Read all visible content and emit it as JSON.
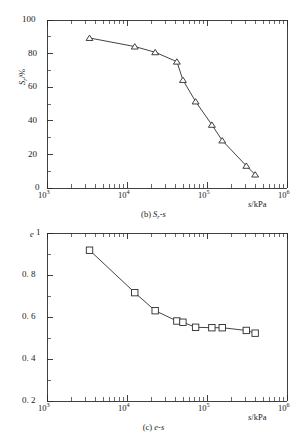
{
  "figure": {
    "background": "#ffffff",
    "ink": "#2b2b2b"
  },
  "panels": [
    {
      "id": "b",
      "caption_id": "(b)",
      "caption_body": "S",
      "caption_sub": "r",
      "caption_tail": "-s",
      "caption_full": "(b) Sr-s"
    },
    {
      "id": "c",
      "caption_id": "(c)",
      "caption_body": "e",
      "caption_sub": "",
      "caption_tail": "-s",
      "caption_full": "(c) e-s"
    }
  ],
  "chart_data": [
    {
      "type": "line",
      "id": "panel-b",
      "title": "(b) Sr-s",
      "xlabel": "s/kPa",
      "ylabel": "Sr/%",
      "ylabel_main": "S",
      "ylabel_sub": "r",
      "ylabel_unit": "/%",
      "xscale": "log",
      "yscale": "linear",
      "xlim": [
        1000,
        1000000
      ],
      "ylim": [
        0,
        100
      ],
      "xticks": [
        1000,
        10000,
        100000,
        1000000
      ],
      "xticklabels": [
        "10³",
        "10⁴",
        "10⁵",
        "10⁶"
      ],
      "xtick_exponents": [
        3,
        4,
        5,
        6
      ],
      "yticks": [
        0,
        20,
        40,
        60,
        80,
        100
      ],
      "yticklabels": [
        "0",
        "20",
        "40",
        "60",
        "80",
        "100"
      ],
      "grid": false,
      "legend": null,
      "marker": "triangle-up-open",
      "series": [
        {
          "name": "Sr",
          "x": [
            3400,
            12500,
            22500,
            42000,
            50000,
            72000,
            115000,
            155000,
            310000,
            400000
          ],
          "y": [
            89.3,
            84.2,
            80.8,
            75.2,
            64.3,
            51.5,
            37.6,
            28.3,
            13.2,
            8.0
          ]
        }
      ]
    },
    {
      "type": "line",
      "id": "panel-c",
      "title": "(c) e-s",
      "xlabel": "s/kPa",
      "ylabel": "e",
      "ylabel_main": "e",
      "ylabel_sub": "",
      "ylabel_unit": "",
      "xscale": "log",
      "yscale": "linear",
      "xlim": [
        1000,
        1000000
      ],
      "ylim": [
        0.2,
        1.0
      ],
      "xticks": [
        1000,
        10000,
        100000,
        1000000
      ],
      "xticklabels": [
        "10³",
        "10⁴",
        "10⁵",
        "10⁶"
      ],
      "xtick_exponents": [
        3,
        4,
        5,
        6
      ],
      "yticks": [
        0.2,
        0.4,
        0.6,
        0.8,
        1.0
      ],
      "yticklabels": [
        "0. 2",
        "0. 4",
        "0. 6",
        "0. 8",
        "1"
      ],
      "grid": false,
      "legend": null,
      "marker": "square-open",
      "series": [
        {
          "name": "e",
          "x": [
            3400,
            12500,
            22500,
            42000,
            50000,
            72000,
            115000,
            155000,
            310000,
            400000
          ],
          "y": [
            0.918,
            0.716,
            0.63,
            0.581,
            0.575,
            0.551,
            0.549,
            0.549,
            0.536,
            0.523
          ]
        }
      ]
    }
  ]
}
